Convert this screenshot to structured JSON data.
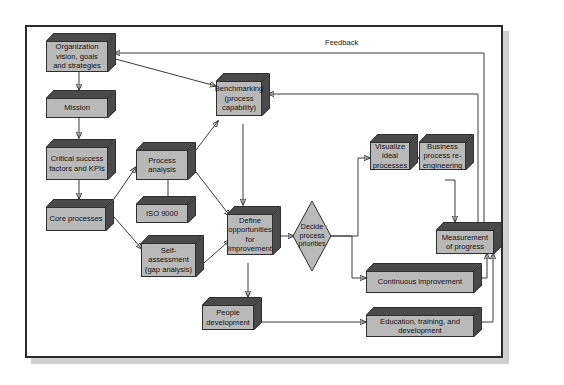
{
  "figure": {
    "background": "#ffffff",
    "frame_border": "#2b2b2b",
    "box_face_color": "#b9b9b9",
    "box_shade_color": "#4a4a4a",
    "line_color": "#3a3a3a"
  },
  "labels": {
    "feedback": "Feedback"
  },
  "nodes": [
    {
      "id": "org",
      "label": "Organization vision, goals and strategies",
      "shape": "box"
    },
    {
      "id": "mission",
      "label": "Mission",
      "shape": "box"
    },
    {
      "id": "csf",
      "label": "Critical success factors and KPIs",
      "shape": "box"
    },
    {
      "id": "core",
      "label": "Core processes",
      "shape": "box"
    },
    {
      "id": "procanal",
      "label": "Process analysis",
      "shape": "box"
    },
    {
      "id": "iso",
      "label": "ISO 9000",
      "shape": "box"
    },
    {
      "id": "selfassess",
      "label": "Self-assessment (gap analysis)",
      "shape": "box"
    },
    {
      "id": "bench",
      "label": "Benchmarking (process capability)",
      "shape": "box"
    },
    {
      "id": "define",
      "label": "Define opportunities for improvement",
      "shape": "box"
    },
    {
      "id": "decide",
      "label": "Decide process priorities",
      "shape": "diamond"
    },
    {
      "id": "visual",
      "label": "Visualize ideal processes",
      "shape": "box"
    },
    {
      "id": "bpr",
      "label": "Business process re-engineering",
      "shape": "box"
    },
    {
      "id": "measure",
      "label": "Measurement of progress",
      "shape": "box"
    },
    {
      "id": "contimp",
      "label": "Continuous improvement",
      "shape": "box"
    },
    {
      "id": "people",
      "label": "People development",
      "shape": "box"
    },
    {
      "id": "education",
      "label": "Education, training, and development",
      "shape": "box"
    }
  ],
  "edges": [
    {
      "from": "org",
      "to": "mission",
      "kind": "arrow"
    },
    {
      "from": "mission",
      "to": "csf",
      "kind": "arrow"
    },
    {
      "from": "csf",
      "to": "core",
      "kind": "arrow"
    },
    {
      "from": "org",
      "to": "bench",
      "kind": "arrow"
    },
    {
      "from": "core",
      "to": "procanal",
      "kind": "arrow"
    },
    {
      "from": "core",
      "to": "selfassess",
      "kind": "arrow"
    },
    {
      "from": "procanal",
      "to": "iso",
      "kind": "plain"
    },
    {
      "from": "procanal",
      "to": "bench",
      "kind": "arrow"
    },
    {
      "from": "procanal",
      "to": "define",
      "kind": "arrow"
    },
    {
      "from": "selfassess",
      "to": "define",
      "kind": "arrow"
    },
    {
      "from": "bench",
      "to": "define",
      "kind": "arrow"
    },
    {
      "from": "define",
      "to": "decide",
      "kind": "arrow"
    },
    {
      "from": "define",
      "to": "people",
      "kind": "arrow"
    },
    {
      "from": "decide",
      "to": "visual",
      "kind": "arrow"
    },
    {
      "from": "decide",
      "to": "contimp",
      "kind": "arrow"
    },
    {
      "from": "visual",
      "to": "bpr",
      "kind": "arrow"
    },
    {
      "from": "bpr",
      "to": "measure",
      "kind": "arrow"
    },
    {
      "from": "people",
      "to": "education",
      "kind": "arrow"
    },
    {
      "from": "contimp",
      "to": "measure",
      "kind": "arrow"
    },
    {
      "from": "education",
      "to": "measure",
      "kind": "arrow"
    },
    {
      "from": "measure",
      "to": "org",
      "kind": "arrow",
      "note": "Feedback"
    },
    {
      "from": "measure",
      "to": "bench",
      "kind": "arrow"
    }
  ]
}
